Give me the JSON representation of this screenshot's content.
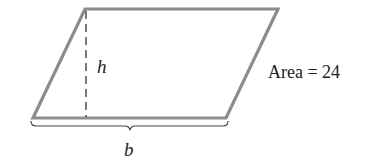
{
  "figure": {
    "shape": "parallelogram",
    "labels": {
      "height": "h",
      "base": "b",
      "area": "Area = 24"
    },
    "colors": {
      "edge": "#8c8c8c",
      "dashed_height": "#333333",
      "text": "#222222",
      "background": "#ffffff"
    }
  }
}
